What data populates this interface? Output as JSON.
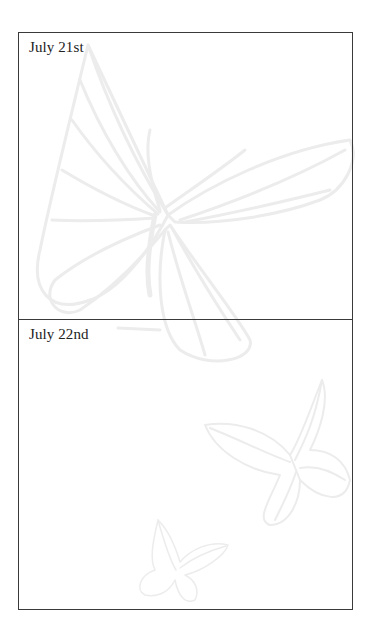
{
  "entries": [
    {
      "date": "July 21st"
    },
    {
      "date": "July 22nd"
    }
  ],
  "decorations": {
    "watermark": "butterfly-illustrations",
    "color": "#ececec"
  }
}
